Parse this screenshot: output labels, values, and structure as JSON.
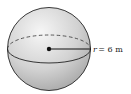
{
  "diagram": {
    "shape": "sphere",
    "radius_label": "r = 6 m",
    "radius_var": "r",
    "radius_value": "= 6 m",
    "colors": {
      "outline": "#222222",
      "shade_light": "#f4f4f4",
      "shade_dark": "#a9a9a9",
      "center_dot": "#111111"
    }
  }
}
